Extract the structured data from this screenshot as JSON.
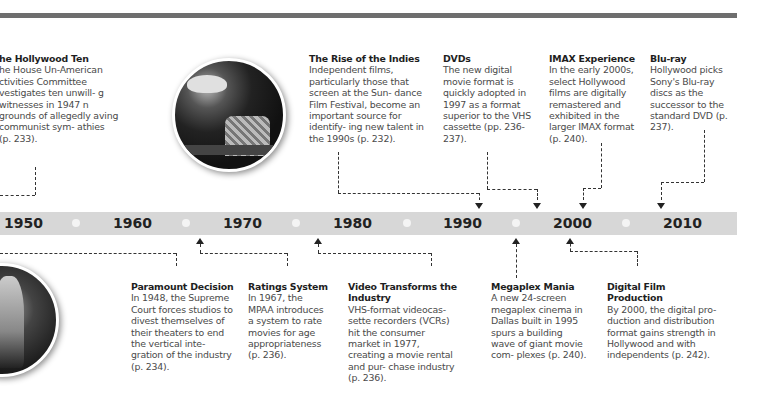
{
  "colors": {
    "topbar": "#6e6e6e",
    "timeline_bar": "#d7d7d7",
    "dot": "#f4f4f4",
    "text": "#4a4a4a",
    "title": "#1e1e1e"
  },
  "timeline": {
    "years": [
      "1950",
      "1960",
      "1970",
      "1980",
      "1990",
      "2000",
      "2010"
    ]
  },
  "events_above": [
    {
      "title": "he Hollywood Ten",
      "desc": "he House Un-American ctivities Committee vestigates ten unwill- g witnesses in 1947 n grounds of allegedly aving communist sym- athies (p. 233)."
    },
    {
      "title": "The Rise of the Indies",
      "desc": "Independent films, particularly those that screen at the Sun- dance Film Festival, become an important source for identify- ing new talent in the 1990s (p. 232)."
    },
    {
      "title": "DVDs",
      "desc": "The new digital movie format is quickly adopted in 1997 as a format superior to the VHS cassette (pp. 236-237)."
    },
    {
      "title": "IMAX Experience",
      "desc": "In the early 2000s, select Hollywood films are digitally remastered and exhibited in the larger IMAX format (p. 240)."
    },
    {
      "title": "Blu-ray",
      "desc": "Hollywood picks Sony's Blu-ray discs as the successor to the standard DVD (p. 237)."
    }
  ],
  "events_below": [
    {
      "title": "Paramount Decision",
      "desc": "In 1948, the Supreme Court forces studios to divest themselves of their theaters to end the vertical inte- gration of the industry (p. 234)."
    },
    {
      "title": "Ratings System",
      "desc": "In 1967, the MPAA introduces a system to rate movies for age appropriateness (p. 236)."
    },
    {
      "title": "Video Transforms the Industry",
      "desc": "VHS-format videocas- sette recorders (VCRs) hit the consumer market in 1977, creating a movie rental and pur- chase industry (p. 236)."
    },
    {
      "title": "Megaplex Mania",
      "desc": "A new 24-screen megaplex cinema in Dallas built in 1995 spurs a building wave of giant movie com- plexes (p. 240)."
    },
    {
      "title": "Digital Film Production",
      "desc": "By 2000, the digital pro- duction and distribution format gains strength in Hollywood and with independents (p. 242)."
    }
  ],
  "photos": [
    {
      "name": "film-crew-photo"
    },
    {
      "name": "vintage-performer-photo"
    }
  ]
}
